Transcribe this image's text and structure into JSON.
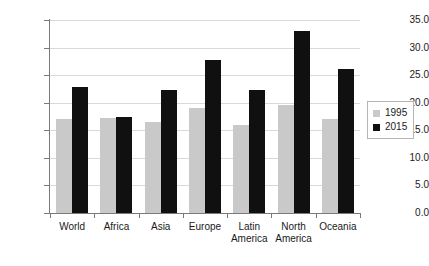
{
  "chart_data": {
    "type": "bar",
    "title": "",
    "subtitle": "",
    "xlabel": "",
    "ylabel": "",
    "categories": [
      "World",
      "Africa",
      "Asia",
      "Europe",
      "Latin America",
      "North America",
      "Oceania"
    ],
    "category_lines": [
      [
        "World"
      ],
      [
        "Africa"
      ],
      [
        "Asia"
      ],
      [
        "Europe"
      ],
      [
        "Latin",
        "America"
      ],
      [
        "North",
        "America"
      ],
      [
        "Oceania"
      ]
    ],
    "series": [
      {
        "name": "1995",
        "color": "#c9c9c9",
        "values": [
          17.0,
          17.3,
          16.5,
          19.0,
          16.0,
          19.6,
          17.0
        ]
      },
      {
        "name": "2015",
        "color": "#101010",
        "values": [
          22.9,
          17.4,
          22.3,
          27.8,
          22.3,
          33.0,
          26.2
        ]
      }
    ],
    "ylim": [
      0.0,
      35.0
    ],
    "ytick_values": [
      0.0,
      5.0,
      10.0,
      15.0,
      20.0,
      25.0,
      30.0,
      35.0
    ],
    "ytick_labels": [
      "0.0",
      "5.0",
      "10.0",
      "15.0",
      "20.0",
      "25.0",
      "30.0",
      "35.0"
    ],
    "grid": true,
    "grid_axis": "y",
    "legend_position": "right",
    "legend_entries": [
      {
        "label": "1995",
        "color": "#c9c9c9"
      },
      {
        "label": "2015",
        "color": "#101010"
      }
    ],
    "background_color": "#ffffff",
    "axis_color": "#7a7a7a",
    "gridline_color": "#d9d9d9"
  }
}
